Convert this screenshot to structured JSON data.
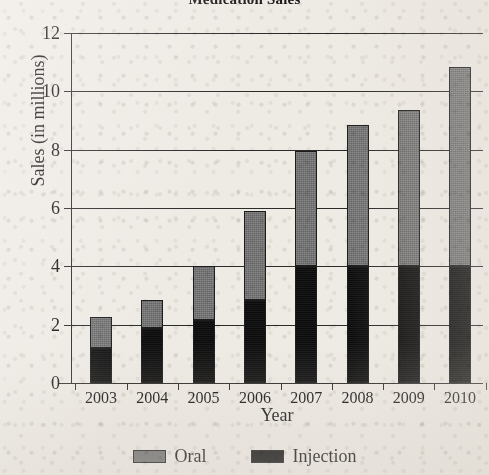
{
  "chart_data": {
    "type": "bar",
    "subtype": "stacked-vertical",
    "title": "Medication Sales",
    "xlabel": "Year",
    "ylabel": "Sales (in millions)",
    "categories": [
      "2003",
      "2004",
      "2005",
      "2006",
      "2007",
      "2008",
      "2009",
      "2010"
    ],
    "series": [
      {
        "name": "Injection",
        "color": "#0d0d0d",
        "values": [
          1.2,
          1.9,
          2.15,
          2.85,
          4.0,
          4.0,
          4.0,
          4.0
        ]
      },
      {
        "name": "Oral",
        "color": "#6f6f6f",
        "values": [
          1.05,
          0.95,
          1.85,
          3.05,
          3.95,
          4.85,
          5.35,
          6.85
        ]
      }
    ],
    "totals": [
      2.25,
      2.85,
      4.0,
      5.9,
      7.95,
      8.85,
      9.35,
      10.85
    ],
    "ylim": [
      0,
      12
    ],
    "yticks": [
      "0",
      "2",
      "4",
      "6",
      "8",
      "10",
      "12"
    ],
    "ytick_values": [
      0,
      2,
      4,
      6,
      8,
      10,
      12
    ],
    "grid": "horizontal",
    "legend_position": "bottom",
    "stack_order": [
      "Injection",
      "Oral"
    ]
  },
  "legend": {
    "entries": [
      {
        "label": "Oral",
        "swatch_color": "#6f6f6f",
        "swatch_name": "legend-swatch-oral"
      },
      {
        "label": "Injection",
        "swatch_color": "#0d0d0d",
        "swatch_name": "legend-swatch-injection"
      }
    ]
  }
}
